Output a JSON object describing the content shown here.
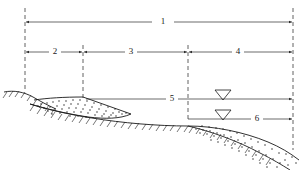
{
  "figure": {
    "background_color": "#ffffff",
    "line_color": "#1a1a1a",
    "width": 303,
    "height": 170
  },
  "dimensions": [
    {
      "id": "dim-1",
      "label": "1",
      "label_x": 163,
      "label_y": 22,
      "y": 22,
      "x1": 25,
      "x2": 293,
      "gap_left": 152,
      "gap_right": 174,
      "arrow_left": true,
      "arrow_right": true
    },
    {
      "id": "dim-2",
      "label": "2",
      "label_x": 55,
      "label_y": 52,
      "y": 52,
      "x1": 25,
      "x2": 83,
      "gap_left": 49,
      "gap_right": 61,
      "arrow_left": true,
      "arrow_right": true
    },
    {
      "id": "dim-3",
      "label": "3",
      "label_x": 131,
      "label_y": 52,
      "y": 52,
      "x1": 83,
      "x2": 188,
      "gap_left": 125,
      "gap_right": 137,
      "arrow_left": true,
      "arrow_right": true
    },
    {
      "id": "dim-4",
      "label": "4",
      "label_x": 238,
      "label_y": 52,
      "y": 52,
      "x1": 188,
      "x2": 293,
      "gap_left": 232,
      "gap_right": 244,
      "arrow_left": true,
      "arrow_right": true
    },
    {
      "id": "dim-5",
      "label": "5",
      "label_x": 172,
      "label_y": 99,
      "y": 99,
      "x1": 86,
      "x2": 293,
      "gap_left": 166,
      "gap_right": 178,
      "arrow_left": false,
      "arrow_right": true
    },
    {
      "id": "dim-6",
      "label": "6",
      "label_x": 257,
      "label_y": 119,
      "y": 119,
      "x1": 188,
      "x2": 293,
      "gap_left": 251,
      "gap_right": 263,
      "arrow_left": false,
      "arrow_right": true
    }
  ],
  "extension_lines": [
    {
      "id": "ext-left",
      "x": 25,
      "y1": 8,
      "y2": 92
    },
    {
      "id": "ext-crest",
      "x": 83,
      "y1": 45,
      "y2": 99
    },
    {
      "id": "ext-toe",
      "x": 188,
      "y1": 45,
      "y2": 121
    },
    {
      "id": "ext-right",
      "x": 293,
      "y1": 8,
      "y2": 150
    }
  ],
  "water_table_symbols": [
    {
      "id": "wt-upper",
      "x": 223,
      "y": 93,
      "half_width": 8,
      "height": 9,
      "level_label": "upper-water-level"
    },
    {
      "id": "wt-lower",
      "x": 223,
      "y": 113,
      "half_width": 8,
      "height": 9,
      "level_label": "lower-water-level"
    }
  ],
  "water_levels": [
    {
      "id": "wt-line-upper",
      "y": 99,
      "x1": 86,
      "x2": 293
    },
    {
      "id": "wt-line-lower",
      "y": 119,
      "x1": 188,
      "x2": 293
    }
  ],
  "ground_profile": {
    "id": "upper-ground-surface",
    "description": "Upper ground surface falling from left to right, through the embankment crest to the toe and beyond",
    "path": "M 4 92 C 18 90, 30 93, 42 99 C 56 105, 72 112, 92 117 C 120 123, 156 126, 188 126 C 218 127, 248 133, 272 144 C 282 149, 290 154, 297 160"
  },
  "fill_surface": {
    "id": "embankment-surface",
    "description": "Top of the stippled fill wedge from left ground to the crest then down the face",
    "path": "M 36 103 C 48 100, 62 99, 83 98 L 128 113 L 128 113 L 66 113"
  },
  "fill_top": {
    "id": "embankment-crest-line",
    "path": "M 36 103 C 50 100, 64 99, 83 98 L 130 114"
  },
  "fill_base": {
    "id": "embankment-base-line",
    "path": "M 30 106 C 46 109, 66 114, 92 117 C 108 119, 120 119, 130 114"
  },
  "right_deposit": {
    "id": "right-sediment-wedge",
    "top_path": "M 188 126 C 216 126, 246 132, 270 142 C 281 147, 290 153, 298 159",
    "bottom_path": "M 188 126 C 212 131, 240 140, 262 152 C 274 158, 284 164, 292 170"
  },
  "stipple": {
    "id": "soil-stipple-pattern",
    "left_wedge_dots": 58,
    "right_wedge_dots": 64,
    "dot_radius": 0.7
  },
  "hatching": {
    "id": "ground-hatch-ticks",
    "description": "Short inclined tick marks below the natural ground line indicating in-situ soil",
    "tick_length": 7,
    "tick_angle_deg": 55
  }
}
